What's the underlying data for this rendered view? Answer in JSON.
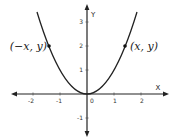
{
  "figure": {
    "type": "function-graph",
    "function": "y = x^2",
    "colors": {
      "curve": "#222222",
      "axes": "#222222",
      "text": "#333333",
      "background": "#ffffff"
    }
  },
  "axes": {
    "x_label": "X",
    "y_label": "Y",
    "x_ticks": [
      {
        "value": -2,
        "label": "-2"
      },
      {
        "value": -1,
        "label": "-1"
      },
      {
        "value": 0,
        "label": "0"
      },
      {
        "value": 1,
        "label": "1"
      },
      {
        "value": 2,
        "label": "2"
      }
    ],
    "y_ticks": [
      {
        "value": 3,
        "label": "3"
      },
      {
        "value": 2,
        "label": "2"
      },
      {
        "value": 1,
        "label": "1"
      },
      {
        "value": -1,
        "label": "-1"
      }
    ],
    "x_range": [
      -2.8,
      2.8
    ],
    "y_range": [
      -1.7,
      3.5
    ]
  },
  "points": [
    {
      "x": -1.414,
      "y": 2,
      "label": "(−x, y)"
    },
    {
      "x": 1.414,
      "y": 2,
      "label": "(x, y)"
    }
  ]
}
